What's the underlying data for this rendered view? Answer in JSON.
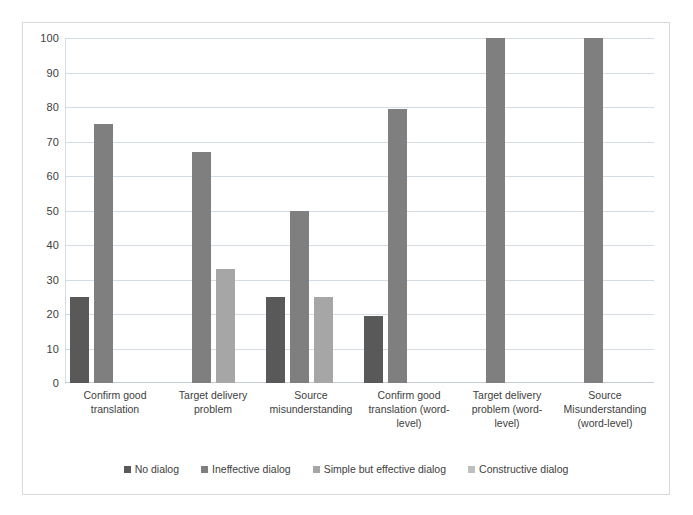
{
  "chart_data": {
    "type": "bar",
    "title": "",
    "xlabel": "",
    "ylabel": "",
    "ylim": [
      0,
      100
    ],
    "y_ticks": [
      100,
      90,
      80,
      70,
      60,
      50,
      40,
      30,
      20,
      10,
      0
    ],
    "grid": true,
    "legend_position": "bottom",
    "categories": [
      "Confirm good translation",
      "Target delivery problem",
      "Source misunderstanding",
      "Confirm good translation (word-level)",
      "Target delivery problem (word-level)",
      "Source Misunderstanding (word-level)"
    ],
    "series": [
      {
        "name": "No dialog",
        "color": "#595959",
        "values": [
          25,
          null,
          25,
          19.5,
          null,
          null
        ]
      },
      {
        "name": "Ineffective dialog",
        "color": "#7f7f7f",
        "values": [
          75,
          67,
          50,
          79.5,
          100,
          100
        ]
      },
      {
        "name": "Simple but effective dialog",
        "color": "#a6a6a6",
        "values": [
          null,
          33,
          25,
          null,
          null,
          null
        ]
      },
      {
        "name": "Constructive dialog",
        "color": "#bfbfbf",
        "values": [
          null,
          null,
          null,
          null,
          null,
          null
        ]
      }
    ]
  },
  "axis": {
    "y_labels": [
      "100",
      "90",
      "80",
      "70",
      "60",
      "50",
      "40",
      "30",
      "20",
      "10",
      "0"
    ]
  },
  "x_axis": {
    "labels": [
      "Confirm good translation",
      "Target delivery problem",
      "Source misunderstanding",
      "Confirm good translation (word-level)",
      "Target delivery problem (word-level)",
      "Source Misunderstanding (word-level)"
    ]
  },
  "legend": {
    "items": [
      {
        "label": "No dialog",
        "color": "#595959"
      },
      {
        "label": "Ineffective dialog",
        "color": "#7f7f7f"
      },
      {
        "label": "Simple but effective dialog",
        "color": "#a6a6a6"
      },
      {
        "label": "Constructive dialog",
        "color": "#bfbfbf"
      }
    ]
  }
}
